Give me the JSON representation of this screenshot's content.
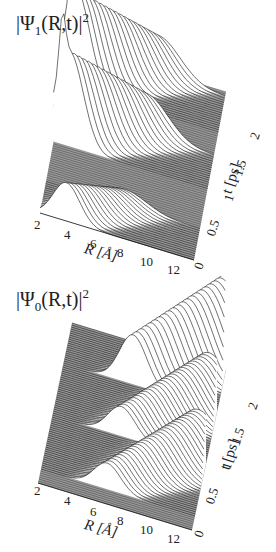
{
  "figure": {
    "panels": [
      {
        "id": "psi1",
        "title_prefix": "|Ψ",
        "title_sub": "1",
        "title_mid": "(R,t)|",
        "title_sup": "2",
        "x_axis_label": "R [Å]",
        "y_axis_label": "t [ps]",
        "x_ticks": [
          "2",
          "4",
          "6",
          "8",
          "10",
          "12"
        ],
        "y_ticks": [
          "0",
          "0.5",
          "1",
          "1.5",
          "2"
        ]
      },
      {
        "id": "psi0",
        "title_prefix": "|Ψ",
        "title_sub": "0",
        "title_mid": "(R,t)|",
        "title_sup": "2",
        "x_axis_label": "R [Å]",
        "y_axis_label": "t [ps]",
        "x_ticks": [
          "2",
          "4",
          "6",
          "8",
          "10",
          "12"
        ],
        "y_ticks": [
          "0",
          "0.5",
          "1",
          "1.5",
          "2"
        ]
      }
    ],
    "colors": {
      "surface": "#9a9a9a",
      "line": "#111111",
      "fill": "#ffffff",
      "text": "#222222"
    }
  },
  "chart_data": [
    {
      "type": "area",
      "subtype": "3d-waterfall",
      "title": "|Ψ1(R,t)|^2",
      "xlabel": "R [Å]",
      "ylabel": "t [ps]",
      "zlabel": "|Ψ1(R,t)|^2",
      "xlim": [
        2,
        12.5
      ],
      "ylim": [
        0,
        2.3
      ],
      "x_ticks": [
        2,
        4,
        6,
        8,
        10,
        12
      ],
      "y_ticks": [
        0,
        0.5,
        1,
        1.5,
        2
      ],
      "grid": false,
      "legend": null,
      "features": [
        {
          "t_start": 0.0,
          "t_end": 0.45,
          "R_center_start": 3.8,
          "R_center_end": 7.5,
          "peak_height": 0.35,
          "description": "initial excited-state wavepacket moving outward"
        },
        {
          "t_start": 0.95,
          "t_end": 1.45,
          "R_center_start": 2.8,
          "R_center_end": 8.0,
          "peak_height": 0.9,
          "description": "second pulse; sharp peak near inner turning point"
        },
        {
          "t_start": 1.75,
          "t_end": 2.25,
          "R_center_start": 2.8,
          "R_center_end": 8.0,
          "peak_height": 0.9,
          "description": "third pulse; sharp peak near inner turning point"
        }
      ]
    },
    {
      "type": "area",
      "subtype": "3d-waterfall",
      "title": "|Ψ0(R,t)|^2",
      "xlabel": "R [Å]",
      "ylabel": "t [ps]",
      "zlabel": "|Ψ0(R,t)|^2",
      "xlim": [
        2,
        12.5
      ],
      "ylim": [
        0,
        2.3
      ],
      "x_ticks": [
        2,
        4,
        6,
        8,
        10,
        12
      ],
      "y_ticks": [
        0,
        0.5,
        1,
        1.5,
        2
      ],
      "grid": false,
      "legend": null,
      "features": [
        {
          "t_start": 0.2,
          "t_end": 0.95,
          "R_center_start": 6.5,
          "R_center_end": 12.0,
          "peak_height": 0.55,
          "description": "ground-state packet moving to large R"
        },
        {
          "t_start": 0.95,
          "t_end": 1.7,
          "R_center_start": 6.5,
          "R_center_end": 12.0,
          "peak_height": 0.6,
          "description": "second outgoing ground-state packet"
        },
        {
          "t_start": 1.7,
          "t_end": 2.3,
          "R_center_start": 6.5,
          "R_center_end": 12.5,
          "peak_height": 1.0,
          "description": "third outgoing packet, sharp peak at large R"
        }
      ]
    }
  ]
}
